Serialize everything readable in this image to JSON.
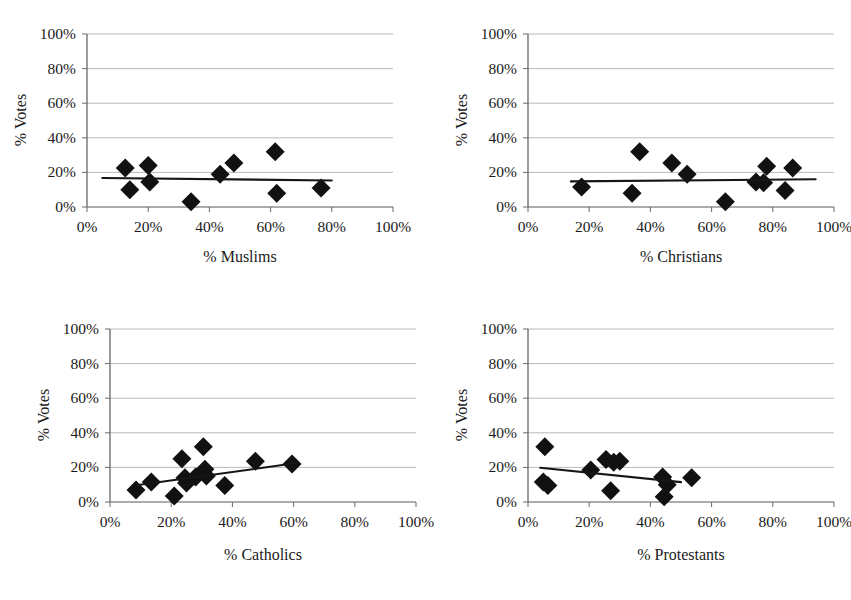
{
  "figure": {
    "title_remnant": "",
    "background": "#ffffff",
    "marker_color": "#111111",
    "trend_color": "#161616",
    "grid_color": "#b9b9b9"
  },
  "chart_data": [
    {
      "id": "muslims",
      "type": "scatter",
      "title": "",
      "xlabel": "% Muslims",
      "ylabel": "% Votes",
      "xlim": [
        0,
        100
      ],
      "ylim": [
        0,
        100
      ],
      "xticks": [
        "0%",
        "20%",
        "40%",
        "60%",
        "80%",
        "100%"
      ],
      "yticks": [
        "0%",
        "20%",
        "40%",
        "60%",
        "80%",
        "100%"
      ],
      "xtick_values": [
        0,
        20,
        40,
        60,
        80,
        100
      ],
      "ytick_values": [
        0,
        20,
        40,
        60,
        80,
        100
      ],
      "grid": "horizontal",
      "legend": "none",
      "points": [
        {
          "x": 12.5,
          "y": 22.5
        },
        {
          "x": 14.0,
          "y": 10.0
        },
        {
          "x": 20.0,
          "y": 24.0
        },
        {
          "x": 20.5,
          "y": 14.5
        },
        {
          "x": 34.0,
          "y": 3.0
        },
        {
          "x": 43.5,
          "y": 19.0
        },
        {
          "x": 48.0,
          "y": 25.5
        },
        {
          "x": 61.5,
          "y": 32.0
        },
        {
          "x": 62.0,
          "y": 8.0
        },
        {
          "x": 76.5,
          "y": 11.0
        }
      ],
      "trendline": {
        "x0": 5.0,
        "y0": 16.8,
        "x1": 80.0,
        "y1": 15.3
      }
    },
    {
      "id": "christians",
      "type": "scatter",
      "title": "",
      "xlabel": "% Christians",
      "ylabel": "% Votes",
      "xlim": [
        0,
        100
      ],
      "ylim": [
        0,
        100
      ],
      "xticks": [
        "0%",
        "20%",
        "40%",
        "60%",
        "80%",
        "100%"
      ],
      "yticks": [
        "0%",
        "20%",
        "40%",
        "60%",
        "80%",
        "100%"
      ],
      "xtick_values": [
        0,
        20,
        40,
        60,
        80,
        100
      ],
      "ytick_values": [
        0,
        20,
        40,
        60,
        80,
        100
      ],
      "grid": "horizontal",
      "legend": "none",
      "points": [
        {
          "x": 17.5,
          "y": 11.5
        },
        {
          "x": 34.0,
          "y": 8.0
        },
        {
          "x": 36.5,
          "y": 32.0
        },
        {
          "x": 47.0,
          "y": 25.5
        },
        {
          "x": 52.0,
          "y": 19.0
        },
        {
          "x": 64.5,
          "y": 3.0
        },
        {
          "x": 74.5,
          "y": 14.5
        },
        {
          "x": 77.0,
          "y": 14.0
        },
        {
          "x": 78.0,
          "y": 23.5
        },
        {
          "x": 84.0,
          "y": 9.5
        },
        {
          "x": 86.5,
          "y": 22.5
        }
      ],
      "trendline": {
        "x0": 14.0,
        "y0": 14.8,
        "x1": 94.0,
        "y1": 16.0
      }
    },
    {
      "id": "catholics",
      "type": "scatter",
      "title": "",
      "xlabel": "% Catholics",
      "ylabel": "% Votes",
      "xlim": [
        0,
        100
      ],
      "ylim": [
        0,
        100
      ],
      "xticks": [
        "0%",
        "20%",
        "40%",
        "60%",
        "80%",
        "100%"
      ],
      "yticks": [
        "0%",
        "20%",
        "40%",
        "60%",
        "80%",
        "100%"
      ],
      "xtick_values": [
        0,
        20,
        40,
        60,
        80,
        100
      ],
      "ytick_values": [
        0,
        20,
        40,
        60,
        80,
        100
      ],
      "grid": "horizontal",
      "legend": "none",
      "points": [
        {
          "x": 8.5,
          "y": 7.0
        },
        {
          "x": 13.5,
          "y": 11.5
        },
        {
          "x": 21.0,
          "y": 3.5
        },
        {
          "x": 23.5,
          "y": 25.0
        },
        {
          "x": 24.5,
          "y": 14.0
        },
        {
          "x": 25.0,
          "y": 11.0
        },
        {
          "x": 28.0,
          "y": 14.5
        },
        {
          "x": 30.5,
          "y": 32.0
        },
        {
          "x": 31.0,
          "y": 19.0
        },
        {
          "x": 31.5,
          "y": 15.0
        },
        {
          "x": 37.5,
          "y": 9.5
        },
        {
          "x": 47.5,
          "y": 23.5
        },
        {
          "x": 59.5,
          "y": 22.0
        }
      ],
      "trendline": {
        "x0": 8.0,
        "y0": 9.5,
        "x1": 61.0,
        "y1": 22.5
      }
    },
    {
      "id": "protestants",
      "type": "scatter",
      "title": "",
      "xlabel": "% Protestants",
      "ylabel": "% Votes",
      "xlim": [
        0,
        100
      ],
      "ylim": [
        0,
        100
      ],
      "xticks": [
        "0%",
        "20%",
        "40%",
        "60%",
        "80%",
        "100%"
      ],
      "yticks": [
        "0%",
        "20%",
        "40%",
        "60%",
        "80%",
        "100%"
      ],
      "xtick_values": [
        0,
        20,
        40,
        60,
        80,
        100
      ],
      "ytick_values": [
        0,
        20,
        40,
        60,
        80,
        100
      ],
      "grid": "horizontal",
      "legend": "none",
      "points": [
        {
          "x": 5.5,
          "y": 32.0
        },
        {
          "x": 5.0,
          "y": 11.5
        },
        {
          "x": 6.5,
          "y": 9.5
        },
        {
          "x": 20.5,
          "y": 18.5
        },
        {
          "x": 25.5,
          "y": 24.5
        },
        {
          "x": 27.0,
          "y": 6.5
        },
        {
          "x": 28.0,
          "y": 23.0
        },
        {
          "x": 30.0,
          "y": 23.5
        },
        {
          "x": 44.0,
          "y": 14.5
        },
        {
          "x": 44.5,
          "y": 3.0
        },
        {
          "x": 45.5,
          "y": 10.0
        },
        {
          "x": 53.5,
          "y": 14.0
        }
      ],
      "trendline": {
        "x0": 4.0,
        "y0": 19.8,
        "x1": 50.0,
        "y1": 11.5
      }
    }
  ]
}
